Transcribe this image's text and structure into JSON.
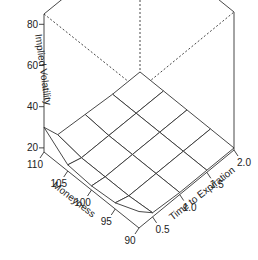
{
  "chart_data": {
    "type": "surface3d",
    "title": "",
    "xlabel": "Moneyness",
    "ylabel": "Time to Expiration",
    "zlabel": "Implied Volatility",
    "x_ticks": [
      "90",
      "95",
      "100",
      "105",
      "110"
    ],
    "y_ticks": [
      "0.5",
      "1.0",
      "1.5",
      "2.0"
    ],
    "z_ticks": [
      "20",
      "40",
      "60",
      "80"
    ],
    "xlim": [
      90,
      110
    ],
    "ylim": [
      0.25,
      2.0
    ],
    "zlim": [
      18,
      85
    ],
    "moneyness": [
      90,
      95,
      100,
      105,
      110
    ],
    "time": [
      0.25,
      0.5,
      1.0,
      1.5,
      2.0
    ],
    "implied_volatility": [
      [
        26,
        20,
        19,
        19,
        19
      ],
      [
        21,
        19,
        19,
        19,
        19
      ],
      [
        20,
        19,
        19,
        19,
        19
      ],
      [
        21,
        19,
        19,
        19,
        19
      ],
      [
        30,
        21,
        20,
        19,
        19
      ]
    ],
    "style": {
      "line_color": "#333333",
      "surface_fill": "#ffffff",
      "box_hidden_dash": true
    }
  }
}
